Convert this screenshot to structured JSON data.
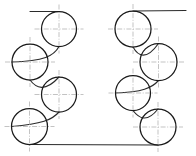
{
  "drawing": {
    "title": "Serpentine pulley layout line drawing",
    "canvas": {
      "width": 196,
      "height": 156,
      "background": "#ffffff"
    },
    "colors": {
      "outline": "#1a1a1a",
      "path": "#2b2b2b",
      "centerline": "#a9a9a9",
      "background": "#ffffff"
    },
    "circles": [
      {
        "id": "circle-top-left",
        "cx": 59,
        "cy": 29,
        "r": 17.5,
        "column": "left",
        "index": 1
      },
      {
        "id": "circle-upper-mid-left",
        "cx": 30,
        "cy": 62,
        "r": 18.0,
        "column": "left",
        "index": 2
      },
      {
        "id": "circle-lower-mid-left",
        "cx": 59,
        "cy": 94.5,
        "r": 17.5,
        "column": "left",
        "index": 3
      },
      {
        "id": "circle-bottom-left",
        "cx": 29.5,
        "cy": 126.5,
        "r": 18.0,
        "column": "left",
        "index": 4
      },
      {
        "id": "circle-top-right",
        "cx": 133,
        "cy": 29,
        "r": 18.0,
        "column": "right",
        "index": 1
      },
      {
        "id": "circle-upper-mid-right",
        "cx": 158.5,
        "cy": 62,
        "r": 18.5,
        "column": "right",
        "index": 2
      },
      {
        "id": "circle-lower-mid-right",
        "cx": 133,
        "cy": 93,
        "r": 17.5,
        "column": "right",
        "index": 3
      },
      {
        "id": "circle-bottom-right",
        "cx": 158,
        "cy": 127,
        "r": 18.0,
        "column": "right",
        "index": 4
      }
    ],
    "center_marks": {
      "overhang": 7,
      "style": "dash-dot"
    },
    "tangent_lines": [
      {
        "id": "top-left-tangent",
        "x1": 30,
        "y1": 11.5,
        "x2": 59,
        "y2": 11.5
      },
      {
        "id": "top-right-tangent",
        "x1": 133,
        "y1": 11.0,
        "x2": 186,
        "y2": 10.5
      },
      {
        "id": "bottom-tangent",
        "x1": 29.5,
        "y1": 144.5,
        "x2": 158,
        "y2": 145.0
      }
    ],
    "connecting_arcs": [
      {
        "id": "arc-left-1-2",
        "d": "M 59 46.5 C 54 56 44 61 12 62"
      },
      {
        "id": "arc-left-2-3",
        "d": "M 30 80 C 36 88 45 92.5 59 77"
      },
      {
        "id": "arc-left-3-4",
        "d": "M 59 112 C 52 120 42 124 11.5 126.5"
      },
      {
        "id": "arc-right-1-2",
        "d": "M 133 47 C 138 56 146 61 158.5 43.5"
      },
      {
        "id": "arc-right-2-3",
        "d": "M 158.5 80.5 C 152 88 142 92 115.5 93"
      },
      {
        "id": "arc-right-3-4",
        "d": "M 133 110.5 C 139 118.5 147 123 158 109"
      }
    ],
    "metrics": {
      "circle_count": 8,
      "left_column_count": 4,
      "right_column_count": 4,
      "tangent_line_count": 3,
      "arc_count": 6
    }
  }
}
